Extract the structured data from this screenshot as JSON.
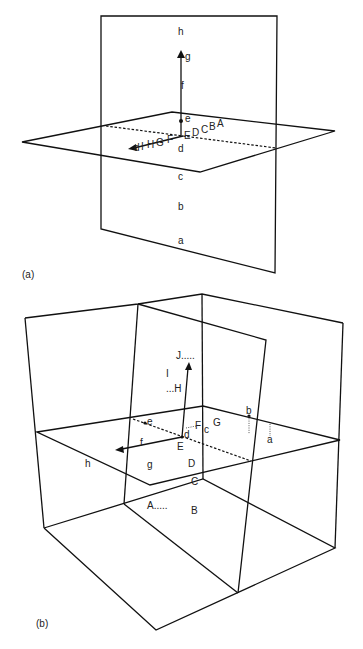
{
  "figure_a": {
    "caption": "(a)",
    "vertical_plane_labels": [
      "h",
      "g",
      "f",
      "e",
      "d",
      "c",
      "b",
      "a"
    ],
    "horizontal_axis_labels_right": [
      "E",
      "D",
      "C",
      "B",
      "A"
    ],
    "horizontal_axis_labels_left": [
      "F",
      "G",
      "H",
      "I",
      "d"
    ]
  },
  "figure_b": {
    "caption": "(b)",
    "labels": {
      "J": "J.....",
      "I": "I",
      "H": "...H",
      "e": "e",
      "F": "F",
      "c": "c",
      "G": "G",
      "b": "b",
      "a": "a",
      "d": "d",
      "E": "E",
      "f": "f",
      "h": "h",
      "g": "g",
      "D": "D",
      "C": "C",
      "A": "A.....",
      "B": "B"
    }
  }
}
